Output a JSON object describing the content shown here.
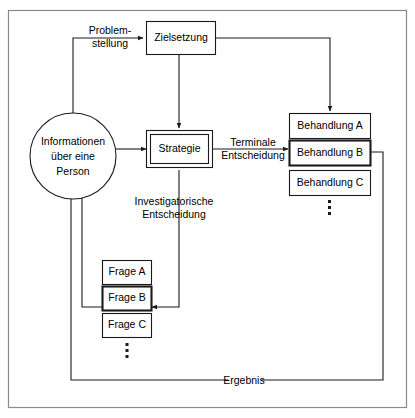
{
  "diagram": {
    "nodes": {
      "info": {
        "name": "informationen-circle",
        "lines": [
          "Informationen",
          "über eine",
          "Person"
        ]
      },
      "zielsetzung": {
        "name": "zielsetzung-box",
        "label": "Zielsetzung"
      },
      "strategie": {
        "name": "strategie-box",
        "label": "Strategie"
      },
      "behandlung_a": {
        "name": "behandlung-a-box",
        "label": "Behandlung A"
      },
      "behandlung_b": {
        "name": "behandlung-b-box",
        "label": "Behandlung B",
        "highlighted": true
      },
      "behandlung_c": {
        "name": "behandlung-c-box",
        "label": "Behandlung C"
      },
      "frage_a": {
        "name": "frage-a-box",
        "label": "Frage A"
      },
      "frage_b": {
        "name": "frage-b-box",
        "label": "Frage B",
        "highlighted": true
      },
      "frage_c": {
        "name": "frage-c-box",
        "label": "Frage C"
      }
    },
    "edge_labels": {
      "problemstellung_line1": "Problem-",
      "problemstellung_line2": "stellung",
      "terminale_line1": "Terminale",
      "terminale_line2": "Entscheidung",
      "investigatorische_line1": "Investigatorische",
      "investigatorische_line2": "Entscheidung",
      "ergebnis": "Ergebnis"
    },
    "colors": {
      "stroke": "#1a1a1a",
      "frame": "#8a8a8a",
      "background": "#ffffff"
    }
  }
}
